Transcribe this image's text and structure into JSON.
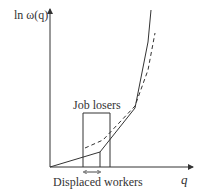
{
  "diagram": {
    "y_axis_label": "ln ω(q)",
    "x_axis_label": "q",
    "box_label": "Job losers",
    "bottom_label": "Displaced workers",
    "colors": {
      "line": "#333333",
      "background": "#ffffff"
    },
    "solid_curve_points": [
      [
        50,
        167
      ],
      [
        100,
        152
      ],
      [
        135,
        108
      ],
      [
        148,
        42
      ],
      [
        151,
        10
      ]
    ],
    "dashed_curve_points": [
      [
        85,
        148
      ],
      [
        103,
        140
      ],
      [
        135,
        106
      ],
      [
        148,
        70
      ],
      [
        155,
        33
      ]
    ]
  }
}
